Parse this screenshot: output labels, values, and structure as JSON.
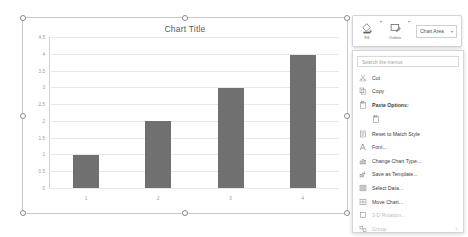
{
  "chart_data": {
    "type": "bar",
    "title": "Chart Title",
    "categories": [
      "1",
      "2",
      "3",
      "4"
    ],
    "values": [
      1,
      2,
      3,
      4
    ],
    "series": [
      {
        "name": "Series 1",
        "values": [
          1,
          2,
          3,
          4
        ]
      }
    ],
    "yticks": [
      "4.5",
      "4",
      "3.5",
      "3",
      "2.5",
      "2",
      "1.5",
      "1",
      "0.5",
      "0"
    ],
    "ylim": [
      0,
      4.5
    ],
    "xlabel": "",
    "ylabel": "",
    "grid": true,
    "legend": "none",
    "bar_color": "#707070",
    "gridline_color": "#e8e8e8"
  },
  "mini_toolbar": {
    "fill_label": "Fill",
    "outline_label": "Outline",
    "fill_caret": "▾",
    "outline_caret": "▾",
    "selector_value": "Chart Area",
    "selector_chevron": "▾"
  },
  "context_menu": {
    "search_placeholder": "Search the menus",
    "items": [
      {
        "label": "Cut",
        "icon": "cut-icon",
        "bold": false,
        "disabled": false,
        "submenu": false
      },
      {
        "label": "Copy",
        "icon": "copy-icon",
        "bold": false,
        "disabled": false,
        "submenu": false
      },
      {
        "label": "Paste Options:",
        "icon": "paste-icon",
        "bold": true,
        "disabled": false,
        "submenu": false
      },
      {
        "label": "Reset to Match Style",
        "icon": "reset-style-icon",
        "bold": false,
        "disabled": false,
        "submenu": false
      },
      {
        "label": "Font...",
        "icon": "font-icon",
        "bold": false,
        "disabled": false,
        "submenu": false
      },
      {
        "label": "Change Chart Type...",
        "icon": "change-chart-type-icon",
        "bold": false,
        "disabled": false,
        "submenu": false
      },
      {
        "label": "Save as Template...",
        "icon": "save-template-icon",
        "bold": false,
        "disabled": false,
        "submenu": false
      },
      {
        "label": "Select Data...",
        "icon": "select-data-icon",
        "bold": false,
        "disabled": false,
        "submenu": false
      },
      {
        "label": "Move Chart...",
        "icon": "move-chart-icon",
        "bold": false,
        "disabled": false,
        "submenu": false
      },
      {
        "label": "3-D Rotation...",
        "icon": "rotation-icon",
        "bold": false,
        "disabled": true,
        "submenu": false
      },
      {
        "label": "Group",
        "icon": "group-icon",
        "bold": false,
        "disabled": true,
        "submenu": true
      }
    ],
    "submenu_arrow": "›"
  }
}
